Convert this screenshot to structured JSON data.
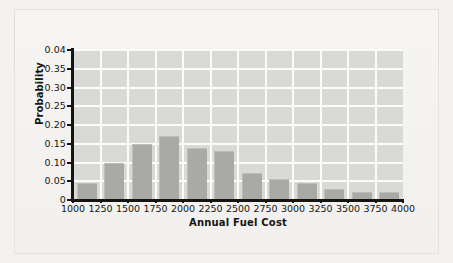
{
  "chart_data": {
    "type": "bar",
    "title": "",
    "subtitle": "",
    "xlabel": "Annual Fuel Cost",
    "ylabel": "Probability",
    "grid": true,
    "legend": "none",
    "xlim": [
      1000,
      4000
    ],
    "ylim": [
      0,
      0.4
    ],
    "x_tick_labels": [
      "1000",
      "1250",
      "1500",
      "1750",
      "2000",
      "2250",
      "2500",
      "2750",
      "3000",
      "3250",
      "3500",
      "3750",
      "4000"
    ],
    "x_tick_values": [
      1000,
      1250,
      1500,
      1750,
      2000,
      2250,
      2500,
      2750,
      3000,
      3250,
      3500,
      3750,
      4000
    ],
    "y_tick_labels": [
      "0.04",
      "0.35",
      "0.30",
      "0.25",
      "0.20",
      "0.15",
      "0.10",
      "0.05",
      "0"
    ],
    "y_tick_values": [
      0.4,
      0.35,
      0.3,
      0.25,
      0.2,
      0.15,
      0.1,
      0.05,
      0
    ],
    "bin_edges": [
      1000,
      1250,
      1500,
      1750,
      2000,
      2250,
      2500,
      2750,
      3000,
      3250,
      3500,
      3750,
      4000
    ],
    "categories": [
      "1000-1250",
      "1250-1500",
      "1500-1750",
      "1750-2000",
      "2000-2250",
      "2250-2500",
      "2500-2750",
      "2750-3000",
      "3000-3250",
      "3250-3500",
      "3500-3750",
      "3750-4000"
    ],
    "values": [
      0.045,
      0.1,
      0.15,
      0.17,
      0.14,
      0.13,
      0.073,
      0.055,
      0.045,
      0.03,
      0.022,
      0.022
    ],
    "bar_color": "#a9a9a7",
    "plot_background": "#d9d9d7",
    "gridline_color": "#fbfbfa",
    "axis_color": "#15140f",
    "page_background": "#f3f2f0"
  }
}
